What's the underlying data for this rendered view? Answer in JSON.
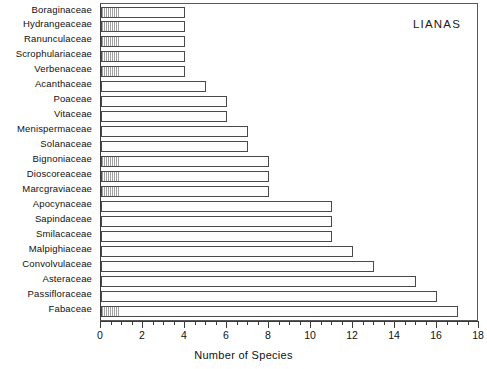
{
  "chart_data": {
    "type": "bar",
    "orientation": "horizontal",
    "title": "",
    "annotation": "LIANAS",
    "xlabel": "Number of Species",
    "ylabel": "",
    "xlim": [
      0,
      18
    ],
    "xticks": [
      0,
      2,
      4,
      6,
      8,
      10,
      12,
      14,
      16,
      18
    ],
    "minor_tick_step": 0.5,
    "grid": false,
    "legend": null,
    "categories": [
      "Boraginaceae",
      "Hydrangeaceae",
      "Ranunculaceae",
      "Scrophulariaceae",
      "Verbenaceae",
      "Acanthaceae",
      "Poaceae",
      "Vitaceae",
      "Menispermaceae",
      "Solanaceae",
      "Bignoniaceae",
      "Dioscoreaceae",
      "Marcgraviaceae",
      "Apocynaceae",
      "Sapindaceae",
      "Smilacaceae",
      "Malpighiaceae",
      "Convolvulaceae",
      "Asteraceae",
      "Passifloraceae",
      "Fabaceae"
    ],
    "values": [
      4,
      4,
      4,
      4,
      4,
      5,
      6,
      6,
      7,
      7,
      8,
      8,
      8,
      11,
      11,
      11,
      12,
      13,
      15,
      16,
      17
    ]
  },
  "colors": {
    "bar_border": "#4a4a4a",
    "bar_fill": "#fdfdfd",
    "axis": "#3a3a3a",
    "text": "#111111",
    "background": "#ffffff"
  }
}
